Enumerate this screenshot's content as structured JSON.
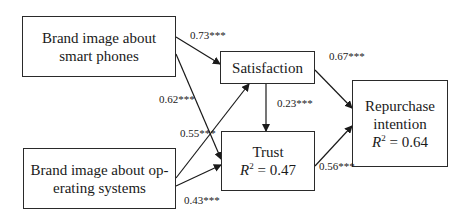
{
  "nodes": {
    "brand_phones": {
      "line1": "Brand image about",
      "line2": "smart phones"
    },
    "brand_os": {
      "line1": "Brand image about op-",
      "line2": "erating systems"
    },
    "satisfaction": {
      "label": "Satisfaction"
    },
    "trust": {
      "label": "Trust",
      "r2_symbol": "R",
      "r2_sup": "2",
      "r2_value": " = 0.47"
    },
    "repurchase": {
      "line1": "Repurchase",
      "line2": "intention",
      "r2_symbol": "R",
      "r2_sup": "2",
      "r2_value": " = 0.64"
    }
  },
  "paths": {
    "phones_to_satisfaction": "0.73***",
    "phones_to_trust": "0.62***",
    "os_to_satisfaction": "0.55***",
    "os_to_trust": "0.43***",
    "satisfaction_to_trust": "0.23***",
    "satisfaction_to_repurchase": "0.67***",
    "trust_to_repurchase": "0.56***"
  }
}
